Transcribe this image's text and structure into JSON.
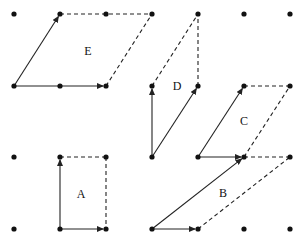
{
  "diagram": {
    "title": "",
    "grid": {
      "columns_x": [
        14,
        60,
        106,
        152,
        198,
        244,
        290
      ],
      "rows_y": [
        14,
        86,
        157,
        229
      ]
    },
    "parallelograms": [
      {
        "label": "E",
        "label_pos": [
          88,
          55
        ],
        "solid_vectors": [
          [
            [
              14,
              86
            ],
            [
              60,
              14
            ]
          ],
          [
            [
              14,
              86
            ],
            [
              106,
              86
            ]
          ]
        ],
        "dashed_edges": [
          [
            [
              60,
              14
            ],
            [
              152,
              14
            ]
          ],
          [
            [
              106,
              86
            ],
            [
              152,
              14
            ]
          ]
        ]
      },
      {
        "label": "D",
        "label_pos": [
          177,
          90
        ],
        "solid_vectors": [
          [
            [
              152,
              157
            ],
            [
              152,
              86
            ]
          ],
          [
            [
              152,
              157
            ],
            [
              198,
              86
            ]
          ]
        ],
        "dashed_edges": [
          [
            [
              152,
              86
            ],
            [
              198,
              14
            ]
          ],
          [
            [
              198,
              86
            ],
            [
              198,
              14
            ]
          ]
        ]
      },
      {
        "label": "C",
        "label_pos": [
          244,
          125
        ],
        "solid_vectors": [
          [
            [
              198,
              157
            ],
            [
              244,
              86
            ]
          ],
          [
            [
              198,
              157
            ],
            [
              244,
              157
            ]
          ]
        ],
        "dashed_edges": [
          [
            [
              244,
              86
            ],
            [
              290,
              86
            ]
          ],
          [
            [
              244,
              157
            ],
            [
              290,
              86
            ]
          ]
        ]
      },
      {
        "label": "A",
        "label_pos": [
          81,
          198
        ],
        "solid_vectors": [
          [
            [
              60,
              229
            ],
            [
              60,
              157
            ]
          ],
          [
            [
              60,
              229
            ],
            [
              106,
              229
            ]
          ]
        ],
        "dashed_edges": [
          [
            [
              60,
              157
            ],
            [
              106,
              157
            ]
          ],
          [
            [
              106,
              157
            ],
            [
              106,
              229
            ]
          ]
        ]
      },
      {
        "label": "B",
        "label_pos": [
          223,
          197
        ],
        "solid_vectors": [
          [
            [
              152,
              229
            ],
            [
              244,
              157
            ]
          ],
          [
            [
              152,
              229
            ],
            [
              198,
              229
            ]
          ]
        ],
        "dashed_edges": [
          [
            [
              244,
              157
            ],
            [
              290,
              157
            ]
          ],
          [
            [
              198,
              229
            ],
            [
              290,
              157
            ]
          ]
        ]
      }
    ]
  }
}
